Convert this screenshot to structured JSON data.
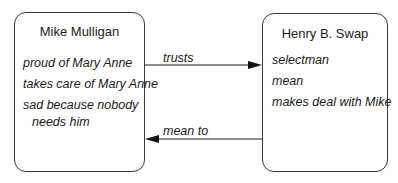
{
  "diagram": {
    "nodes": [
      {
        "id": "mike",
        "title": "Mike Mulligan",
        "attributes": [
          "proud of Mary Anne",
          "takes care of Mary Anne",
          "sad because nobody",
          "needs him"
        ]
      },
      {
        "id": "henry",
        "title": "Henry B. Swap",
        "attributes": [
          "selectman",
          "mean",
          "makes deal with Mike"
        ]
      }
    ],
    "edges": [
      {
        "from": "mike",
        "to": "henry",
        "label": "trusts"
      },
      {
        "from": "henry",
        "to": "mike",
        "label": "mean to"
      }
    ]
  }
}
